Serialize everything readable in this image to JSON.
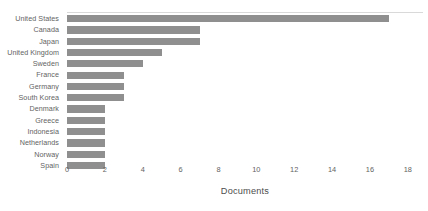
{
  "chart_data": {
    "type": "bar",
    "orientation": "horizontal",
    "title": "",
    "subtitle": "",
    "xlabel": "Documents",
    "ylabel": "",
    "categories": [
      "United States",
      "Canada",
      "Japan",
      "United Kingdom",
      "Sweden",
      "France",
      "Germany",
      "South Korea",
      "Denmark",
      "Greece",
      "Indonesia",
      "Netherlands",
      "Norway",
      "Spain"
    ],
    "values": [
      17,
      7,
      7,
      5,
      4,
      3,
      3,
      3,
      2,
      2,
      2,
      2,
      2,
      2
    ],
    "xlim": [
      0,
      18.8
    ],
    "xticks": [
      0,
      2,
      4,
      6,
      8,
      10,
      12,
      14,
      16,
      18
    ],
    "xtick_labels": [
      "0",
      "2",
      "4",
      "6",
      "8",
      "10",
      "12",
      "14",
      "16",
      "18"
    ],
    "grid": false,
    "legend": false,
    "bar_color": "#8f8f8f",
    "axis_rule_color": "#d9d9d9",
    "text_color": "#636363",
    "background": "#ffffff"
  }
}
